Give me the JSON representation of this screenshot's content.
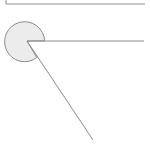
{
  "diagram": {
    "type": "angle-wedge",
    "colors": {
      "background": "#ffffff",
      "stroke": "#8c8c8c",
      "fill": "#ececec"
    },
    "frame_corner": {
      "x": 6,
      "y_top": 0,
      "y_bottom": 4,
      "x_end": 145
    },
    "vertex": {
      "x": 27,
      "y": 41
    },
    "circle": {
      "cx": 25,
      "cy": 40,
      "r": 20
    },
    "ray_horizontal": {
      "x2": 144,
      "y2": 41
    },
    "ray_diagonal": {
      "x2": 93,
      "y2": 140
    }
  }
}
